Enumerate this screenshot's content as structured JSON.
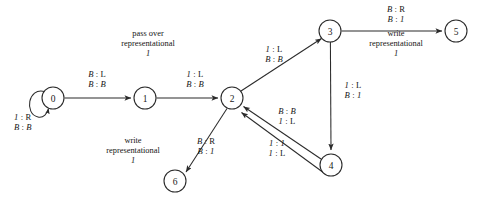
{
  "figure": {
    "type": "state-transition-diagram",
    "title": "",
    "caption_fragment": ""
  },
  "nodes": [
    {
      "id": "0",
      "label": "0",
      "cx": 53,
      "cy": 98,
      "r": 11
    },
    {
      "id": "1",
      "label": "1",
      "cx": 145,
      "cy": 98,
      "r": 11
    },
    {
      "id": "2",
      "label": "2",
      "cx": 232,
      "cy": 98,
      "r": 11
    },
    {
      "id": "3",
      "label": "3",
      "cx": 330,
      "cy": 31,
      "r": 11
    },
    {
      "id": "4",
      "label": "4",
      "cx": 331,
      "cy": 165,
      "r": 11
    },
    {
      "id": "5",
      "label": "5",
      "cx": 456,
      "cy": 31,
      "r": 11
    },
    {
      "id": "6",
      "label": "6",
      "cx": 175,
      "cy": 181,
      "r": 11
    }
  ],
  "edges": [
    {
      "id": "e-self-0",
      "from": "0",
      "to": "0",
      "kind": "self-loop",
      "label_line1": "1 : R",
      "label_line2": "B : B",
      "label_x": 28,
      "label_y": 116
    },
    {
      "id": "e-0-1",
      "from": "0",
      "to": "1",
      "kind": "straight",
      "label_line1": "B : L",
      "label_line2": "B : B",
      "label_x": 97,
      "label_y": 71
    },
    {
      "id": "e-1-2",
      "from": "1",
      "to": "2",
      "kind": "straight",
      "label_line1": "1 : L",
      "label_line2": "B : B",
      "label_x": 195,
      "label_y": 71
    },
    {
      "id": "e-2-3",
      "from": "2",
      "to": "3",
      "kind": "straight",
      "label_line1": "1 : L",
      "label_line2": "B : B",
      "label_x": 274,
      "label_y": 46
    },
    {
      "id": "e-3-5",
      "from": "3",
      "to": "5",
      "kind": "straight",
      "label_line1": "B : R",
      "label_line2": "B : 1",
      "label_x": 396,
      "label_y": 6
    },
    {
      "id": "e-3-4",
      "from": "3",
      "to": "4",
      "kind": "straight",
      "label_line1": "1 : L",
      "label_line2": "B : 1",
      "label_x": 352,
      "label_y": 82
    },
    {
      "id": "e-4-2-upper",
      "from": "4",
      "to": "2",
      "kind": "parallel-upper",
      "label_line1": "B : B",
      "label_line2": "1 : L",
      "label_x": 285,
      "label_y": 108
    },
    {
      "id": "e-4-2-lower",
      "from": "4",
      "to": "2",
      "kind": "parallel-lower",
      "label_line1": "1 : 1",
      "label_line2": "1 : L",
      "label_x": 277,
      "label_y": 140
    },
    {
      "id": "e-2-6",
      "from": "2",
      "to": "6",
      "kind": "straight",
      "label_line1": "B : R",
      "label_line2": "B : 1",
      "label_x": 203,
      "label_y": 138
    }
  ],
  "annotations": [
    {
      "id": "annot-pass-over",
      "line1": "pass over",
      "line2": "representational",
      "line3": "1",
      "x": 148,
      "y": 31,
      "related_edge": "e-0-1"
    },
    {
      "id": "annot-write-5",
      "line1": "write",
      "line2": "representational",
      "line3": "1",
      "x": 396,
      "y": 31,
      "related_edge": "e-3-5"
    },
    {
      "id": "annot-write-6",
      "line1": "write",
      "line2": "representational",
      "line3": "1",
      "x": 133,
      "y": 138,
      "related_edge": "e-2-6"
    }
  ],
  "colors": {
    "stroke": "#2b2b2b",
    "text": "#141414",
    "background": "#ffffff"
  }
}
